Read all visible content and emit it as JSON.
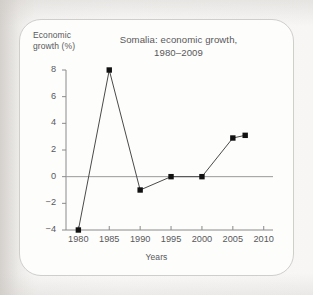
{
  "figure": {
    "chart_title_line1": "Somalia: economic growth,",
    "chart_title_line2": "1980–2009",
    "y_axis_title_line1": "Economic",
    "y_axis_title_line2": "growth (%)",
    "x_axis_title": "Years"
  },
  "chart_data": {
    "type": "line",
    "title": "Somalia: economic growth, 1980–2009",
    "xlabel": "Years",
    "ylabel": "Economic growth (%)",
    "xlim": [
      1978,
      2011.5
    ],
    "ylim": [
      -4,
      8
    ],
    "xticks": [
      1980,
      1985,
      1990,
      1995,
      2000,
      2005,
      2010
    ],
    "xtick_labels": [
      "1980",
      "1985",
      "1990",
      "1995",
      "2000",
      "2005",
      "2010"
    ],
    "yticks": [
      -4,
      -2,
      0,
      2,
      4,
      6,
      8
    ],
    "ytick_labels": [
      "−4",
      "−2",
      "0",
      "2",
      "4",
      "6",
      "8"
    ],
    "grid": false,
    "legend": false,
    "zero_line": true,
    "marker": "square",
    "line_color": "#4a4a4a",
    "marker_color": "#111111",
    "axis_color": "#8a8a8a",
    "text_color": "#58585a",
    "x": [
      1980,
      1985,
      1990,
      1995,
      2000,
      2005,
      2007
    ],
    "values": [
      -4,
      8,
      -1,
      0,
      0,
      2.9,
      3.1
    ],
    "points": [
      {
        "year": 1980,
        "growth": -4
      },
      {
        "year": 1985,
        "growth": 8
      },
      {
        "year": 1990,
        "growth": -1
      },
      {
        "year": 1995,
        "growth": 0
      },
      {
        "year": 2000,
        "growth": 0
      },
      {
        "year": 2005,
        "growth": 2.9
      },
      {
        "year": 2007,
        "growth": 3.1
      }
    ]
  },
  "colors": {
    "card_background": "#fdfdfc",
    "card_border": "#cfcecb",
    "page_background": "#f2f1ef"
  }
}
